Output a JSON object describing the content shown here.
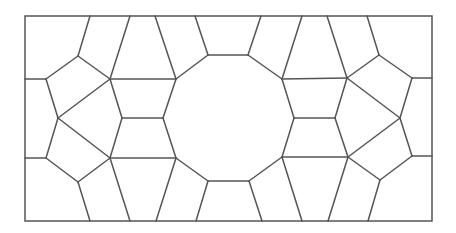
{
  "diagram": {
    "type": "geometric-tiling",
    "stroke_color": "#555555",
    "stroke_width": 1.5,
    "background": "#ffffff",
    "frame": {
      "x": 25,
      "y": 16,
      "width": 407,
      "height": 205
    },
    "vertices": {
      "A": [
        90,
        16
      ],
      "B": [
        130,
        16
      ],
      "C": [
        155,
        16
      ],
      "D": [
        195,
        16
      ],
      "E": [
        261,
        16
      ],
      "F": [
        302,
        16
      ],
      "G": [
        327,
        16
      ],
      "H": [
        367,
        16
      ],
      "a": [
        90,
        221
      ],
      "b": [
        130,
        221
      ],
      "c": [
        156,
        221
      ],
      "d": [
        196,
        221
      ],
      "e": [
        262,
        221
      ],
      "f": [
        302,
        221
      ],
      "g": [
        328,
        221
      ],
      "h": [
        368,
        221
      ],
      "L1": [
        25,
        79
      ],
      "L2": [
        25,
        158
      ],
      "R1": [
        432,
        78
      ],
      "R2": [
        432,
        156
      ],
      "TL": [
        78,
        56
      ],
      "BL": [
        78,
        182
      ],
      "TR": [
        379,
        55
      ],
      "BR": [
        380,
        180
      ],
      "P1": [
        46,
        79
      ],
      "P2": [
        58,
        118
      ],
      "P3": [
        46,
        158
      ],
      "Q1": [
        110,
        79
      ],
      "Q2": [
        122,
        118
      ],
      "Q3": [
        110,
        158
      ],
      "D1": [
        176,
        79
      ],
      "D2": [
        208,
        55
      ],
      "D3": [
        248,
        55
      ],
      "D4": [
        282,
        79
      ],
      "D5": [
        294,
        118
      ],
      "D6": [
        282,
        157
      ],
      "D7": [
        249,
        181
      ],
      "D8": [
        208,
        181
      ],
      "D9": [
        176,
        158
      ],
      "D10": [
        163,
        118
      ],
      "S1": [
        347,
        78
      ],
      "S2": [
        335,
        118
      ],
      "S3": [
        348,
        157
      ],
      "T1": [
        412,
        78
      ],
      "T2": [
        400,
        118
      ],
      "T3": [
        412,
        156
      ]
    },
    "edges": [
      [
        "A",
        "TL"
      ],
      [
        "TL",
        "P1"
      ],
      [
        "TL",
        "Q1"
      ],
      [
        "P1",
        "L1"
      ],
      [
        "P1",
        "P2"
      ],
      [
        "B",
        "Q1"
      ],
      [
        "C",
        "D1"
      ],
      [
        "D",
        "D2"
      ],
      [
        "E",
        "D3"
      ],
      [
        "F",
        "D4"
      ],
      [
        "Q1",
        "D1"
      ],
      [
        "Q1",
        "P2"
      ],
      [
        "Q1",
        "Q2"
      ],
      [
        "P2",
        "Q3"
      ],
      [
        "P2",
        "P3"
      ],
      [
        "Q2",
        "D10"
      ],
      [
        "Q2",
        "Q3"
      ],
      [
        "Q3",
        "D9"
      ],
      [
        "P3",
        "L2"
      ],
      [
        "P3",
        "BL"
      ],
      [
        "BL",
        "Q3"
      ],
      [
        "BL",
        "a"
      ],
      [
        "Q3",
        "b"
      ],
      [
        "D9",
        "c"
      ],
      [
        "D8",
        "d"
      ],
      [
        "D7",
        "e"
      ],
      [
        "D6",
        "f"
      ],
      [
        "D1",
        "D2"
      ],
      [
        "D2",
        "D3"
      ],
      [
        "D3",
        "D4"
      ],
      [
        "D4",
        "D5"
      ],
      [
        "D5",
        "D6"
      ],
      [
        "D6",
        "D7"
      ],
      [
        "D7",
        "D8"
      ],
      [
        "D8",
        "D9"
      ],
      [
        "D9",
        "D10"
      ],
      [
        "D10",
        "D1"
      ],
      [
        "D4",
        "S1"
      ],
      [
        "G",
        "S1"
      ],
      [
        "H",
        "TR"
      ],
      [
        "TR",
        "S1"
      ],
      [
        "TR",
        "T1"
      ],
      [
        "T1",
        "R1"
      ],
      [
        "T1",
        "T2"
      ],
      [
        "S1",
        "S2"
      ],
      [
        "S1",
        "T2"
      ],
      [
        "S2",
        "D5"
      ],
      [
        "S2",
        "S3"
      ],
      [
        "T2",
        "S3"
      ],
      [
        "T2",
        "T3"
      ],
      [
        "T3",
        "R2"
      ],
      [
        "T3",
        "BR"
      ],
      [
        "BR",
        "S3"
      ],
      [
        "BR",
        "h"
      ],
      [
        "S3",
        "D6"
      ],
      [
        "S3",
        "g"
      ]
    ],
    "central_polygon": {
      "label": "decagon",
      "vertices": [
        "D1",
        "D2",
        "D3",
        "D4",
        "D5",
        "D6",
        "D7",
        "D8",
        "D9",
        "D10"
      ]
    }
  }
}
